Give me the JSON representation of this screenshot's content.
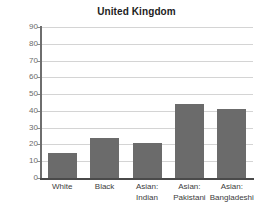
{
  "chart_data": {
    "type": "bar",
    "title": "United Kingdom",
    "xlabel": "",
    "ylabel": "",
    "ylim": [
      0,
      90
    ],
    "ytick_step": 10,
    "grid": true,
    "legend": "none",
    "bar_color": "#6b6b6b",
    "gridline_color": "#d4d4d4",
    "axis_color": "#4a4a4a",
    "categories": [
      "White",
      "Asian: Indian",
      "Black",
      "Asian: Pakistani",
      "Asian: Bangladeshi"
    ],
    "values": [
      15,
      24,
      21,
      44,
      41
    ],
    "bars": [
      {
        "label_line1": "White",
        "label_line2": "",
        "value": 15
      },
      {
        "label_line1": "Black",
        "label_line2": "",
        "value": 24
      },
      {
        "label_line1": "Asian:",
        "label_line2": "Indian",
        "value": 21
      },
      {
        "label_line1": "Asian:",
        "label_line2": "Pakistani",
        "value": 44
      },
      {
        "label_line1": "Asian:",
        "label_line2": "Bangladeshi",
        "value": 41
      }
    ],
    "ytick_labels": [
      "90",
      "80",
      "70",
      "60",
      "50",
      "40",
      "30",
      "20",
      "10",
      "0"
    ],
    "ytick_values": [
      90,
      80,
      70,
      60,
      50,
      40,
      30,
      20,
      10,
      0
    ]
  },
  "clipped_top_text": ""
}
